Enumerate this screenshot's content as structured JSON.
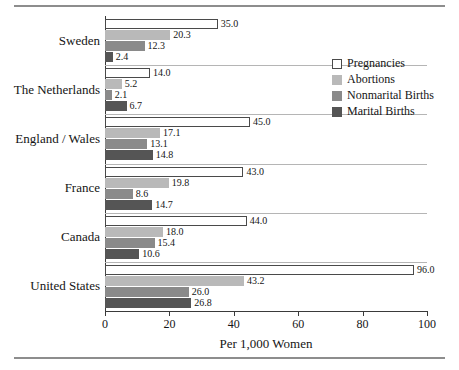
{
  "chart_data": {
    "type": "bar",
    "orientation": "horizontal",
    "title": "",
    "xlabel": "Per 1,000 Women",
    "ylabel": "",
    "xlim": [
      0,
      100
    ],
    "xticks": [
      0,
      20,
      40,
      60,
      80,
      100
    ],
    "grid": false,
    "legend_position": "upper right",
    "categories": [
      "Sweden",
      "The Netherlands",
      "England / Wales",
      "France",
      "Canada",
      "United States"
    ],
    "series": [
      {
        "name": "Pregnancies",
        "color": "#ffffff",
        "values": [
          35.0,
          14.0,
          45.0,
          43.0,
          44.0,
          96.0
        ],
        "labels": [
          "35.0",
          "14.0",
          "45.0",
          "43.0",
          "44.0",
          "96.0"
        ]
      },
      {
        "name": "Abortions",
        "color": "#b9b9b9",
        "values": [
          20.3,
          5.2,
          17.1,
          19.8,
          18.0,
          43.2
        ],
        "labels": [
          "20.3",
          "5.2",
          "17.1",
          "19.8",
          "18.0",
          "43.2"
        ]
      },
      {
        "name": "Nonmarital Births",
        "color": "#8a8a8a",
        "values": [
          12.3,
          2.1,
          13.1,
          8.6,
          15.4,
          26.0
        ],
        "labels": [
          "12.3",
          "2.1",
          "13.1",
          "8.6",
          "15.4",
          "26.0"
        ]
      },
      {
        "name": "Marital Births",
        "color": "#555555",
        "values": [
          2.4,
          6.7,
          14.8,
          14.7,
          10.6,
          26.8
        ],
        "labels": [
          "2.4",
          "6.7",
          "14.8",
          "14.7",
          "10.6",
          "26.8"
        ]
      }
    ]
  },
  "legend": {
    "items": [
      {
        "label": "Pregnancies"
      },
      {
        "label": "Abortions"
      },
      {
        "label": "Nonmarital Births"
      },
      {
        "label": "Marital Births"
      }
    ]
  }
}
